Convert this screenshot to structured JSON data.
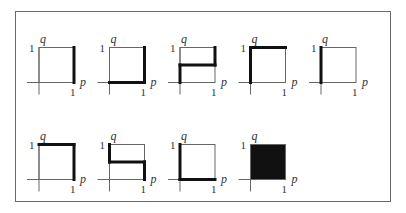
{
  "figure": {
    "axis_labels": {
      "x": "p",
      "y": "q"
    },
    "tick_labels": {
      "x_max": "1",
      "y_max": "1"
    },
    "colors": {
      "frame": "#6a6a6a",
      "thin_line": "#666666",
      "thick_line": "#111111",
      "fill": "#111111"
    },
    "layout": {
      "rows": 2,
      "cols": 5,
      "panel_count": 9
    },
    "panels": [
      {
        "id": 1,
        "row": 0,
        "col": 0,
        "highlight": "right edge",
        "segments": [
          [
            1,
            0,
            1,
            1
          ]
        ],
        "filled": false
      },
      {
        "id": 2,
        "row": 0,
        "col": 1,
        "highlight": "bottom and right edges",
        "segments": [
          [
            0,
            0,
            1,
            0
          ],
          [
            1,
            0,
            1,
            1
          ]
        ],
        "filled": false
      },
      {
        "id": 3,
        "row": 0,
        "col": 2,
        "highlight": "step up: left lower half, middle, right upper half",
        "segments": [
          [
            0,
            0,
            0,
            0.5
          ],
          [
            0,
            0.5,
            1,
            0.5
          ],
          [
            1,
            0.5,
            1,
            1
          ]
        ],
        "filled": false
      },
      {
        "id": 4,
        "row": 0,
        "col": 3,
        "highlight": "left and top edges",
        "segments": [
          [
            0,
            0,
            0,
            1
          ],
          [
            0,
            1,
            1,
            1
          ]
        ],
        "filled": false
      },
      {
        "id": 5,
        "row": 0,
        "col": 4,
        "highlight": "left edge",
        "segments": [
          [
            0,
            0,
            0,
            1
          ]
        ],
        "filled": false
      },
      {
        "id": 6,
        "row": 1,
        "col": 0,
        "highlight": "top and right edges",
        "segments": [
          [
            0,
            1,
            1,
            1
          ],
          [
            1,
            1,
            1,
            0
          ]
        ],
        "filled": false
      },
      {
        "id": 7,
        "row": 1,
        "col": 1,
        "highlight": "step down: left upper half, middle, right lower half",
        "segments": [
          [
            0,
            1,
            0,
            0.5
          ],
          [
            0,
            0.5,
            1,
            0.5
          ],
          [
            1,
            0.5,
            1,
            0
          ]
        ],
        "filled": false
      },
      {
        "id": 8,
        "row": 1,
        "col": 2,
        "highlight": "left and bottom edges",
        "segments": [
          [
            0,
            1,
            0,
            0
          ],
          [
            0,
            0,
            1,
            0
          ]
        ],
        "filled": false
      },
      {
        "id": 9,
        "row": 1,
        "col": 3,
        "highlight": "entire square filled",
        "segments": [],
        "filled": true
      }
    ]
  }
}
